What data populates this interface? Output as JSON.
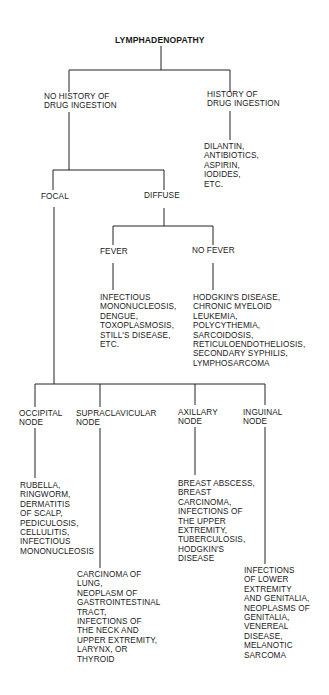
{
  "diagram": {
    "title": "LYMPHADENOPATHY",
    "no_history": "NO HISTORY OF\nDRUG INGESTION",
    "history": "HISTORY OF\nDRUG INGESTION",
    "history_causes": "DILANTIN,\nANTIBIOTICS,\nASPIRIN,\nIODIDES,\nETC.",
    "focal": "FOCAL",
    "diffuse": "DIFFUSE",
    "fever": "FEVER",
    "no_fever": "NO FEVER",
    "fever_causes": "INFECTIOUS\nMONONUCLEOSIS,\nDENGUE,\nTOXOPLASMOSIS,\nSTILL'S DISEASE,\nETC.",
    "no_fever_causes": "HODGKIN'S DISEASE,\nCHRONIC MYELOID\nLEUKEMIA,\nPOLYCYTHEMIA,\nSARCOIDOSIS,\nRETICULOENDOTHELIOSIS,\nSECONDARY SYPHILIS,\nLYMPHOSARCOMA",
    "occipital": "OCCIPITAL\nNODE",
    "supraclavicular": "SUPRACLAVICULAR\nNODE",
    "axillary": "AXILLARY\nNODE",
    "inguinal": "INGUINAL\nNODE",
    "occipital_causes": "RUBELLA,\nRINGWORM,\nDERMATITIS\nOF SCALP,\nPEDICULOSIS,\nCELLULITIS,\nINFECTIOUS\nMONONUCLEOSIS",
    "supraclavicular_causes": "CARCINOMA OF\nLUNG,\nNEOPLASM OF\nGASTROINTESTINAL\nTRACT,\nINFECTIONS OF\nTHE NECK AND\nUPPER EXTREMITY,\nLARYNX, OR\nTHYROID",
    "axillary_causes": "BREAST ABSCESS,\nBREAST\nCARCINOMA,\nINFECTIONS OF\nTHE UPPER\nEXTREMITY,\nTUBERCULOSIS,\nHODGKIN'S\nDISEASE",
    "inguinal_causes": "INFECTIONS\nOF LOWER\nEXTREMITY\nAND GENITALIA,\nNEOPLASMS OF\nGENITALIA,\nVENEREAL\nDISEASE,\nMELANOTIC\nSARCOMA"
  }
}
